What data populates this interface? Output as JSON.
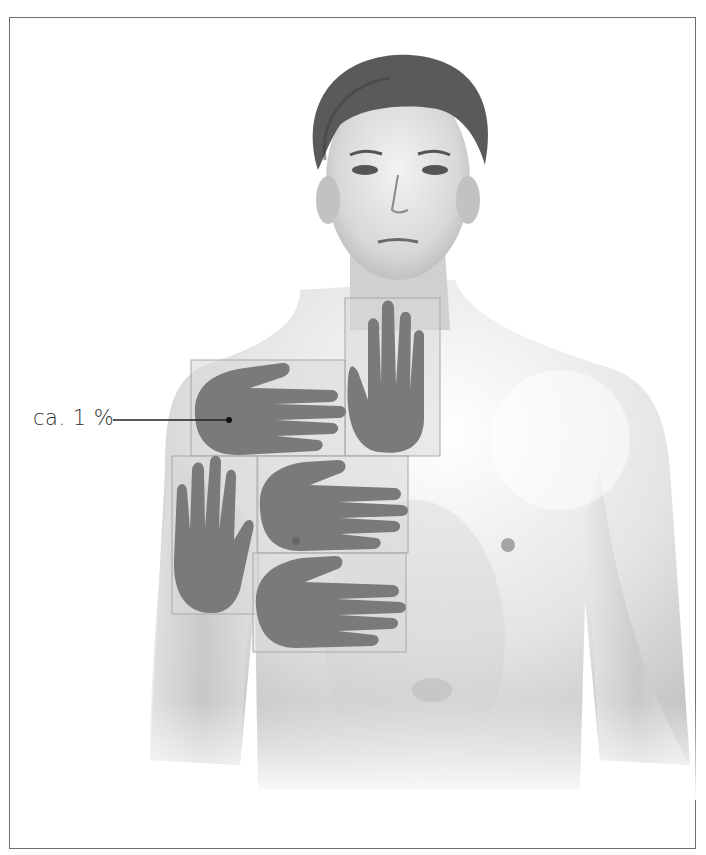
{
  "figure": {
    "annotation": {
      "label": "ca. 1 %",
      "points_to": "palm-outline-upper-arm"
    },
    "palm_overlays": [
      {
        "id": "palm-shoulder-horizontal",
        "orientation": "horizontal"
      },
      {
        "id": "palm-neck-vertical",
        "orientation": "vertical"
      },
      {
        "id": "palm-arm-vertical",
        "orientation": "vertical"
      },
      {
        "id": "palm-chest-horizontal",
        "orientation": "horizontal"
      },
      {
        "id": "palm-lower-chest-horizontal",
        "orientation": "horizontal"
      }
    ],
    "colors": {
      "palm_fill": "#7a7a7a",
      "box_fill": "#d9d9d9",
      "box_stroke": "#a8a8a8",
      "border": "#6e6e6e",
      "skin_shadow": "#b5b5b5",
      "hair": "#5a5a5a"
    }
  }
}
